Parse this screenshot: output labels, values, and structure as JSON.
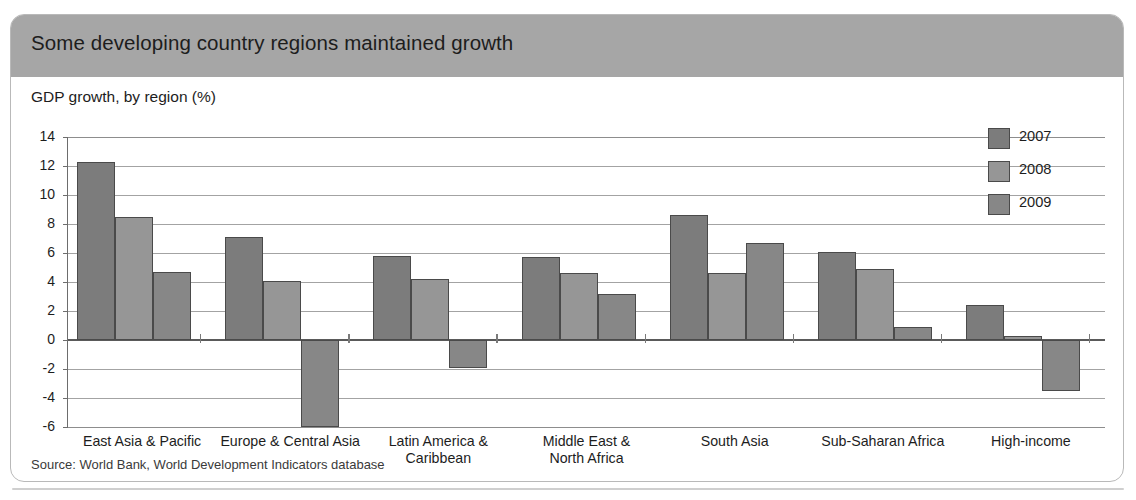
{
  "header": {
    "title": "Some developing country regions maintained growth"
  },
  "subtitle": "GDP growth, by region (%)",
  "source": "Source: World Bank, World Development Indicators database",
  "legend": {
    "position": "top-right",
    "items": [
      {
        "label": "2007",
        "color": "#7c7c7c"
      },
      {
        "label": "2008",
        "color": "#969696"
      },
      {
        "label": "2009",
        "color": "#878787"
      }
    ]
  },
  "chart_data": {
    "type": "bar",
    "title": "Some developing country regions maintained growth",
    "subtitle": "GDP growth, by region (%)",
    "xlabel": "",
    "ylabel": "GDP growth, by region (%)",
    "ylim": [
      -6,
      14
    ],
    "yticks": [
      14,
      12,
      10,
      8,
      6,
      4,
      2,
      0,
      -2,
      -4,
      -6
    ],
    "ytick_labels": [
      "14",
      "12",
      "10",
      "8",
      "6",
      "4",
      "2",
      "0",
      "-2",
      "-4",
      "-6"
    ],
    "grid": true,
    "grid_axis": "y",
    "categories": [
      "East Asia & Pacific",
      "Europe & Central Asia",
      "Latin America & Caribbean",
      "Middle East & North Africa",
      "South Asia",
      "Sub-Saharan Africa",
      "High-income"
    ],
    "category_lines": [
      [
        "East Asia & Pacific"
      ],
      [
        "Europe & Central Asia"
      ],
      [
        "Latin America &",
        "Caribbean"
      ],
      [
        "Middle East &",
        "North Africa"
      ],
      [
        "South Asia"
      ],
      [
        "Sub-Saharan Africa"
      ],
      [
        "High-income"
      ]
    ],
    "series": [
      {
        "name": "2007",
        "color": "#7c7c7c",
        "values": [
          12.3,
          7.1,
          5.8,
          5.7,
          8.6,
          6.1,
          2.4
        ]
      },
      {
        "name": "2008",
        "color": "#969696",
        "values": [
          8.5,
          4.1,
          4.2,
          4.6,
          4.6,
          4.9,
          0.3
        ]
      },
      {
        "name": "2009",
        "color": "#878787",
        "values": [
          4.7,
          -6.0,
          -1.9,
          3.2,
          6.7,
          0.9,
          -3.5
        ]
      }
    ]
  }
}
